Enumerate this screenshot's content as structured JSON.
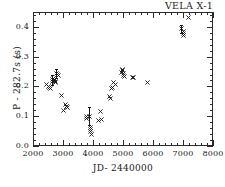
{
  "chart_data": {
    "type": "scatter",
    "title": "VELA X-1",
    "xlabel": "JD- 2440000",
    "ylabel": "P - 282.7s  (s)",
    "xlim": [
      2000,
      8000
    ],
    "ylim": [
      0.0,
      0.45
    ],
    "grid": false,
    "legend": null,
    "marker": "x",
    "xticks": [
      2000,
      3000,
      4000,
      5000,
      6000,
      7000,
      8000
    ],
    "xticklabels": [
      "2000",
      "3000",
      "4000",
      "5000",
      "6000",
      "7000",
      "8000"
    ],
    "yticks": [
      0.0,
      0.1,
      0.2,
      0.3,
      0.4
    ],
    "yticklabels": [
      "0.0",
      "0.1",
      "0.2",
      "0.3",
      "0.4"
    ],
    "x_minor_ticks_per_major": 5,
    "y_minor_ticks_per_major": 5,
    "points": [
      {
        "x": 2450,
        "y": 0.205
      },
      {
        "x": 2500,
        "y": 0.2
      },
      {
        "x": 2540,
        "y": 0.196
      },
      {
        "x": 2590,
        "y": 0.192
      },
      {
        "x": 2640,
        "y": 0.215
      },
      {
        "x": 2660,
        "y": 0.222,
        "yerr": 0.018
      },
      {
        "x": 2680,
        "y": 0.228
      },
      {
        "x": 2700,
        "y": 0.224
      },
      {
        "x": 2720,
        "y": 0.22
      },
      {
        "x": 2740,
        "y": 0.218
      },
      {
        "x": 2760,
        "y": 0.213
      },
      {
        "x": 2790,
        "y": 0.244,
        "yerr": 0.016
      },
      {
        "x": 2810,
        "y": 0.24
      },
      {
        "x": 2840,
        "y": 0.236
      },
      {
        "x": 2950,
        "y": 0.17
      },
      {
        "x": 3020,
        "y": 0.118
      },
      {
        "x": 3080,
        "y": 0.138
      },
      {
        "x": 3100,
        "y": 0.134
      },
      {
        "x": 3120,
        "y": 0.131
      },
      {
        "x": 3140,
        "y": 0.129
      },
      {
        "x": 3780,
        "y": 0.098
      },
      {
        "x": 3790,
        "y": 0.092
      },
      {
        "x": 3880,
        "y": 0.1,
        "yerr": 0.03
      },
      {
        "x": 3900,
        "y": 0.062
      },
      {
        "x": 3910,
        "y": 0.055
      },
      {
        "x": 3920,
        "y": 0.05
      },
      {
        "x": 3940,
        "y": 0.04
      },
      {
        "x": 4180,
        "y": 0.086
      },
      {
        "x": 4260,
        "y": 0.115
      },
      {
        "x": 4270,
        "y": 0.09
      },
      {
        "x": 4560,
        "y": 0.165
      },
      {
        "x": 4570,
        "y": 0.16
      },
      {
        "x": 4600,
        "y": 0.192
      },
      {
        "x": 4640,
        "y": 0.196
      },
      {
        "x": 4680,
        "y": 0.212
      },
      {
        "x": 4740,
        "y": 0.207
      },
      {
        "x": 4960,
        "y": 0.248
      },
      {
        "x": 4970,
        "y": 0.253
      },
      {
        "x": 4990,
        "y": 0.258
      },
      {
        "x": 5010,
        "y": 0.243
      },
      {
        "x": 5030,
        "y": 0.238
      },
      {
        "x": 5050,
        "y": 0.234
      },
      {
        "x": 5300,
        "y": 0.229
      },
      {
        "x": 5360,
        "y": 0.229
      },
      {
        "x": 5800,
        "y": 0.213
      },
      {
        "x": 6940,
        "y": 0.393,
        "yerr": 0.012
      },
      {
        "x": 7000,
        "y": 0.384
      },
      {
        "x": 7010,
        "y": 0.378
      },
      {
        "x": 7020,
        "y": 0.372
      },
      {
        "x": 7180,
        "y": 0.43
      }
    ]
  }
}
